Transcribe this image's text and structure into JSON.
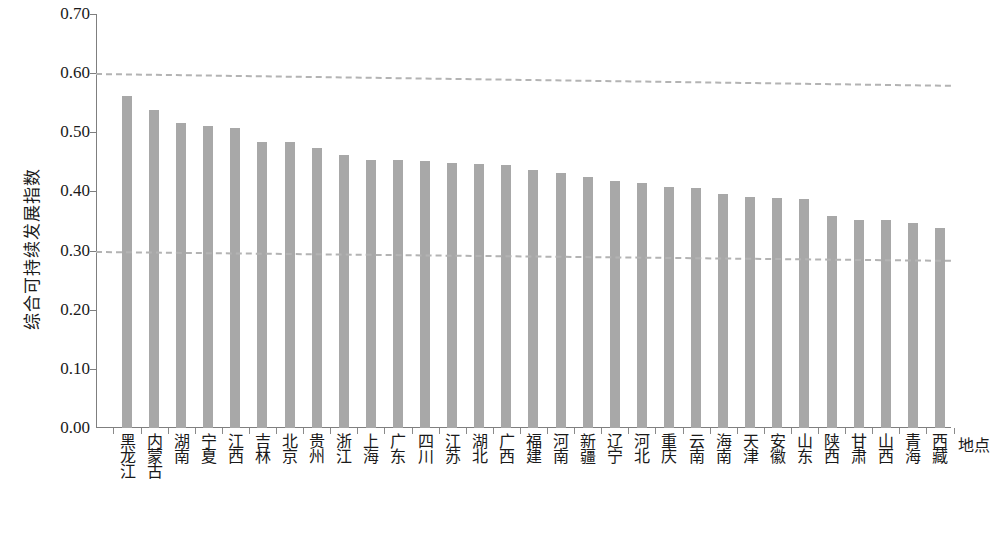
{
  "chart_data": {
    "type": "bar",
    "title": "",
    "xlabel": "地点",
    "ylabel": "综合可持续发展指数",
    "ylim": [
      0.0,
      0.7
    ],
    "ytick_step": 0.1,
    "ytick_labels": [
      "0.70",
      "0.60",
      "0.50",
      "0.40",
      "0.30",
      "0.20",
      "0.10",
      "0.00"
    ],
    "ytick_values": [
      0.7,
      0.6,
      0.5,
      0.4,
      0.3,
      0.2,
      0.1,
      0.0
    ],
    "grid": false,
    "legend": "none",
    "bar_color": "#a8a8a8",
    "trend_color": "#b3b3b3",
    "axis_color": "#7f7f7f",
    "categories": [
      "黑龙江",
      "内蒙古",
      "湖南",
      "宁夏",
      "江西",
      "吉林",
      "北京",
      "贵州",
      "浙江",
      "上海",
      "广东",
      "四川",
      "江苏",
      "湖北",
      "广西",
      "福建",
      "河南",
      "新疆",
      "辽宁",
      "河北",
      "重庆",
      "云南",
      "海南",
      "天津",
      "安徽",
      "山东",
      "陕西",
      "甘肃",
      "山西",
      "青海",
      "西藏"
    ],
    "values": [
      0.562,
      0.538,
      0.516,
      0.51,
      0.507,
      0.483,
      0.483,
      0.473,
      0.461,
      0.453,
      0.453,
      0.452,
      0.448,
      0.447,
      0.445,
      0.437,
      0.432,
      0.425,
      0.418,
      0.415,
      0.408,
      0.405,
      0.396,
      0.391,
      0.389,
      0.387,
      0.358,
      0.352,
      0.351,
      0.346,
      0.338
    ],
    "annotations": [
      {
        "name": "upper-reference-line",
        "type": "dashed-line",
        "y_start": 0.6,
        "y_end": 0.58
      },
      {
        "name": "lower-reference-line",
        "type": "dashed-line",
        "y_start": 0.299,
        "y_end": 0.284
      }
    ]
  },
  "caption": ""
}
